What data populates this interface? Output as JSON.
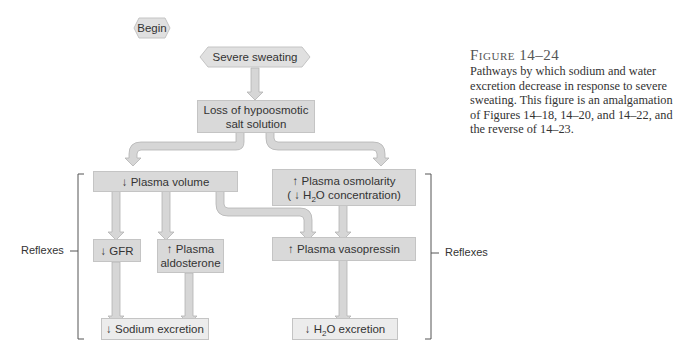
{
  "figure": {
    "title": "Figure 14–24",
    "caption": "Pathways by which sodium and water excretion decrease in response to severe sweating. This figure is an amalgamation of Figures 14–18, 14–20, and 14–22, and the reverse of 14–23."
  },
  "nodes": {
    "begin": "Begin",
    "severe_sweating": "Severe sweating",
    "loss_line1": "Loss of hypoosmotic",
    "loss_line2": "salt solution",
    "plasma_volume": "↓ Plasma volume",
    "osmolarity_line1": "↑ Plasma osmolarity",
    "osmolarity_line2_pre": "( ↓ H",
    "osmolarity_line2_sub": "2",
    "osmolarity_line2_post": "O concentration)",
    "gfr": "↓ GFR",
    "aldosterone_line1": "↑ Plasma",
    "aldosterone_line2": "aldosterone",
    "vasopressin": "↑ Plasma vasopressin",
    "sodium_excretion": "↓ Sodium excretion",
    "h2o_excretion_pre": "↓ H",
    "h2o_excretion_sub": "2",
    "h2o_excretion_post": "O excretion"
  },
  "brackets": {
    "left_label": "Reflexes",
    "right_label": "Reflexes"
  },
  "colors": {
    "box_fill": "#d9d9d9",
    "box_light_fill": "#ececec",
    "arrow_fill": "#d6d6d6",
    "arrow_stroke": "#b5b5b5"
  }
}
